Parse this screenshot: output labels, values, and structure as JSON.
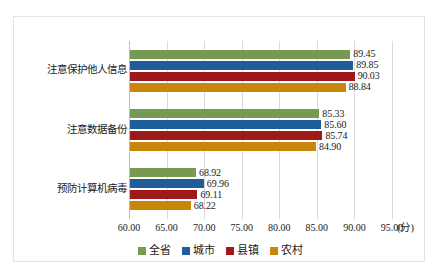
{
  "chart_data": {
    "type": "bar",
    "orientation": "horizontal",
    "title": "",
    "subtitle": "",
    "xlabel": "(分)",
    "ylabel": "",
    "xlim": [
      60.0,
      95.0
    ],
    "grid": true,
    "legend_position": "bottom",
    "categories": [
      "注意保护他人信息",
      "注意数据备份",
      "预防计算机病毒"
    ],
    "series": [
      {
        "name": "全省",
        "color": "#769A52",
        "values": [
          89.45,
          85.33,
          68.92
        ]
      },
      {
        "name": "城市",
        "color": "#1F5C99",
        "values": [
          89.85,
          85.6,
          69.96
        ]
      },
      {
        "name": "县镇",
        "color": "#9E1A1A",
        "values": [
          90.03,
          85.74,
          69.11
        ]
      },
      {
        "name": "农村",
        "color": "#C8860D",
        "values": [
          88.84,
          84.9,
          68.22
        ]
      }
    ],
    "xticks": [
      "60.00",
      "65.00",
      "70.00",
      "75.00",
      "80.00",
      "85.00",
      "90.00",
      "95.00"
    ],
    "xtick_values": [
      60,
      65,
      70,
      75,
      80,
      85,
      90,
      95
    ],
    "value_labels": [
      [
        "89.45",
        "89.85",
        "90.03",
        "88.84"
      ],
      [
        "85.33",
        "85.60",
        "85.74",
        "84.90"
      ],
      [
        "68.92",
        "69.96",
        "69.11",
        "68.22"
      ]
    ]
  },
  "legend": {
    "items": [
      {
        "label": "全省"
      },
      {
        "label": "城市"
      },
      {
        "label": "县镇"
      },
      {
        "label": "农村"
      }
    ]
  }
}
